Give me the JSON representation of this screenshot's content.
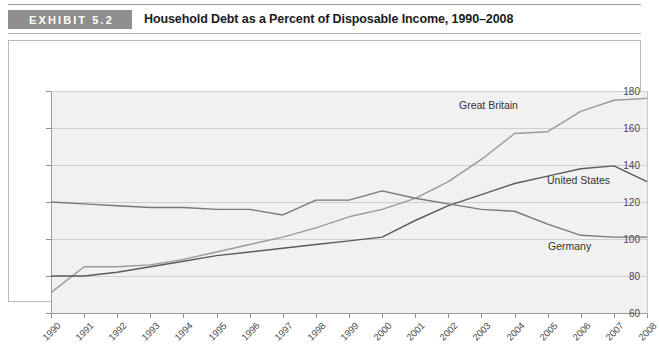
{
  "header": {
    "badge": "EXHIBIT 5.2",
    "title": "Household Debt as a Percent of Disposable Income, 1990–2008"
  },
  "chart_data": {
    "type": "line",
    "title": "Household Debt as a Percent of Disposable Income, 1990–2008",
    "xlabel": "",
    "ylabel": "",
    "grid": true,
    "legend_position": "inline-annotations",
    "ylim": [
      60,
      180
    ],
    "yticks": [
      60,
      80,
      100,
      120,
      140,
      160,
      180
    ],
    "categories": [
      "1990",
      "1991",
      "1992",
      "1993",
      "1994",
      "1995",
      "1996",
      "1997",
      "1998",
      "1999",
      "2000",
      "2001",
      "2002",
      "2003",
      "2004",
      "2005",
      "2006",
      "2007",
      "2008"
    ],
    "series": [
      {
        "name": "Great Britain",
        "color": "#9a9a9a",
        "values": [
          71,
          85,
          85,
          86,
          89,
          93,
          97,
          101,
          106,
          112,
          116,
          122,
          131,
          143,
          157,
          158,
          169,
          175,
          176
        ]
      },
      {
        "name": "United States",
        "color": "#5b5b5b",
        "values": [
          80,
          80,
          82,
          85,
          88,
          91,
          93,
          95,
          97,
          99,
          101,
          110,
          118,
          124,
          130,
          134,
          138,
          139.5,
          131
        ]
      },
      {
        "name": "Germany",
        "color": "#787878",
        "values": [
          120,
          119,
          118,
          117,
          117,
          116,
          116,
          113,
          121,
          121,
          126,
          122,
          119,
          116,
          115,
          108,
          102,
          101,
          101
        ]
      }
    ]
  },
  "annotations": {
    "great_britain": "Great Britain",
    "united_states": "United States",
    "germany": "Germany"
  }
}
